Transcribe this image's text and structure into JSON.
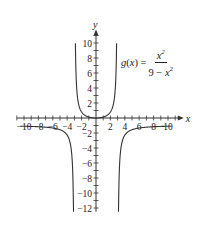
{
  "chart_data": {
    "type": "line",
    "title": "",
    "function_label": "g(x) = x^2 / (9 - x^2)",
    "formula": {
      "lhs_name": "g",
      "lhs_var": "x",
      "equals": "=",
      "numerator": "x",
      "numerator_exp": "2",
      "denominator_prefix": "9 − ",
      "denominator_var": "x",
      "denominator_exp": "2"
    },
    "xlabel": "x",
    "ylabel": "y",
    "xlim": [
      -11,
      11.5
    ],
    "ylim": [
      -12.5,
      11
    ],
    "x_ticks": [
      -10,
      -8,
      -6,
      -4,
      -2,
      2,
      4,
      6,
      8,
      10
    ],
    "y_ticks": [
      -12,
      -10,
      -8,
      -6,
      -4,
      -2,
      2,
      4,
      6,
      8,
      10
    ],
    "x_tick_labels": [
      "−10",
      "−8",
      "−6",
      "−4",
      "−2",
      "2",
      "4",
      "6",
      "8",
      "10"
    ],
    "y_tick_labels": [
      "−12",
      "−10",
      "−8",
      "−6",
      "−4",
      "−2",
      "2",
      "4",
      "6",
      "8",
      "10"
    ],
    "vertical_asymptotes": [
      -3,
      3
    ],
    "horizontal_asymptote": -1,
    "series": [
      {
        "name": "g(x) left branch",
        "x": [
          -10.5,
          -8,
          -6,
          -5,
          -4,
          -3.5,
          -3.3,
          -3.2,
          -3.12
        ],
        "y": [
          -1.09,
          -1.16,
          -1.33,
          -1.56,
          -2.29,
          -3.77,
          -5.76,
          -8.26,
          -12.5
        ]
      },
      {
        "name": "g(x) middle branch",
        "x": [
          -2.86,
          -2.75,
          -2.5,
          -2,
          -1,
          0,
          1,
          2,
          2.5,
          2.75,
          2.86
        ],
        "y": [
          10.3,
          5.76,
          2.27,
          0.8,
          0.125,
          0,
          0.125,
          0.8,
          2.27,
          5.76,
          10.3
        ]
      },
      {
        "name": "g(x) right branch",
        "x": [
          3.12,
          3.2,
          3.3,
          3.5,
          4,
          5,
          6,
          8,
          10.5
        ],
        "y": [
          -12.5,
          -8.26,
          -5.76,
          -3.77,
          -2.29,
          -1.56,
          -1.33,
          -1.16,
          -1.09
        ]
      }
    ],
    "grid": false,
    "legend": "none",
    "layout": {
      "origin_px": [
        96,
        118
      ],
      "x_px_per_unit": 7.2,
      "y_px_per_unit": 7.5
    },
    "colors": {
      "curve": "#333333",
      "axis": "#333333"
    }
  }
}
